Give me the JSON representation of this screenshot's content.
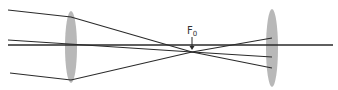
{
  "diagram": {
    "type": "optics-ray-diagram",
    "focal_label": {
      "main": "F",
      "subscript": "0"
    },
    "colors": {
      "ray": "#2a2a2a",
      "lens": "#b8b8b8",
      "background": "#ffffff",
      "label": "#333333"
    },
    "lenses": [
      {
        "name": "left-lens",
        "cx": 71,
        "cy": 47,
        "rx": 6,
        "ry": 36
      },
      {
        "name": "right-lens",
        "cx": 272,
        "cy": 48,
        "rx": 6,
        "ry": 39
      }
    ],
    "optical_axis": {
      "x1": 8,
      "y1": 45,
      "x2": 333,
      "y2": 45
    },
    "focal_point": {
      "x": 192,
      "y": 52
    },
    "rays": [
      {
        "name": "top-ray",
        "points": [
          [
            8,
            10
          ],
          [
            71,
            17
          ],
          [
            192,
            52
          ],
          [
            272,
            68
          ]
        ]
      },
      {
        "name": "center-ray",
        "points": [
          [
            8,
            40
          ],
          [
            192,
            52
          ],
          [
            272,
            57
          ]
        ]
      },
      {
        "name": "bottom-ray",
        "points": [
          [
            10,
            73
          ],
          [
            71,
            80
          ],
          [
            192,
            52
          ],
          [
            272,
            38
          ]
        ]
      }
    ],
    "focal_arrow": {
      "x": 192,
      "y1": 37,
      "y2": 50
    }
  }
}
